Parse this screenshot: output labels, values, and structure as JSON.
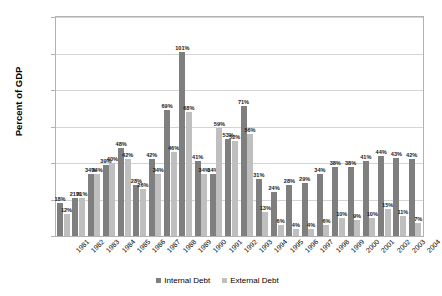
{
  "chart_data": {
    "type": "bar",
    "title": "",
    "subtitle": "",
    "xlabel": "",
    "ylabel": "Percent of GDP",
    "ylim": [
      0,
      120
    ],
    "ytick_step": 20,
    "ytick_labels": [
      "0%",
      "20%",
      "40%",
      "60%",
      "80%",
      "100%",
      "120%"
    ],
    "grid": true,
    "legend_position": "bottom",
    "categories": [
      "1981",
      "1982",
      "1983",
      "1984",
      "1985",
      "1986",
      "1987",
      "1988",
      "1989",
      "1990",
      "1991",
      "1992",
      "1993",
      "1994",
      "1995",
      "1996",
      "1997",
      "1998",
      "1999",
      "2000",
      "2001",
      "2002",
      "2003",
      "2004"
    ],
    "series": [
      {
        "name": "Internal Debt",
        "color": "#7f7f7f",
        "values": [
          18,
          21,
          34,
          39,
          48,
          28,
          42,
          69,
          101,
          41,
          34,
          53,
          71,
          31,
          24,
          28,
          29,
          34,
          38,
          38,
          41,
          44,
          43,
          42
        ],
        "labels": [
          "18%",
          "21%",
          "34%",
          "39%",
          "48%",
          "28%",
          "42%",
          "69%",
          "101%",
          "41%",
          "34%",
          "53%",
          "71%",
          "31%",
          "24%",
          "28%",
          "29%",
          "34%",
          "38%",
          "38%",
          "41%",
          "44%",
          "43%",
          "42%"
        ]
      },
      {
        "name": "External Debt",
        "color": "#bfbfbf",
        "values": [
          12,
          21,
          34,
          40,
          42,
          26,
          34,
          46,
          68,
          34,
          59,
          52,
          56,
          13,
          6,
          4,
          4,
          6,
          10,
          9,
          10,
          15,
          11,
          7
        ],
        "labels": [
          "12%",
          "21%",
          "34%",
          "40%",
          "42%",
          "26%",
          "34%",
          "46%",
          "68%",
          "34%",
          "59%",
          "52%",
          "56%",
          "13%",
          "6%",
          "4%",
          "4%",
          "6%",
          "10%",
          "9%",
          "10%",
          "15%",
          "11%",
          "7%"
        ]
      }
    ]
  },
  "legend": {
    "items": [
      {
        "label": "Internal Debt"
      },
      {
        "label": "External Debt"
      }
    ]
  }
}
